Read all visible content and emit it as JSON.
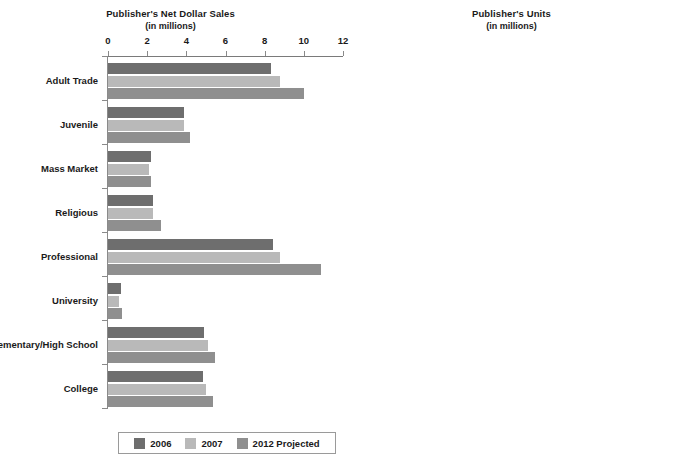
{
  "chart_data": [
    {
      "type": "bar",
      "orientation": "horizontal",
      "title": "Publisher's Net Dollar Sales",
      "subtitle": "(in millions)",
      "xlabel": "",
      "ylabel": "",
      "xlim": [
        0,
        12
      ],
      "xticks": [
        0,
        2,
        4,
        6,
        8,
        10,
        12
      ],
      "xtick_labels": [
        "0",
        "2",
        "4",
        "6",
        "8",
        "10",
        "12"
      ],
      "grid": false,
      "legend_position": "bottom",
      "categories": [
        "Adult Trade",
        "Juvenile",
        "Mass Market",
        "Religious",
        "Professional",
        "University",
        "Elementary/High School",
        "College"
      ],
      "series": [
        {
          "name": "2006",
          "color": "#6e6e6e",
          "values": [
            8.3,
            3.9,
            2.2,
            2.3,
            8.4,
            0.65,
            4.9,
            4.85
          ]
        },
        {
          "name": "2007",
          "color": "#b9b9b9",
          "values": [
            8.8,
            3.9,
            2.1,
            2.3,
            8.8,
            0.55,
            5.1,
            5.0
          ]
        },
        {
          "name": "2012 Projected",
          "color": "#8f8f8f",
          "values": [
            10.0,
            4.2,
            2.2,
            2.7,
            10.9,
            0.7,
            5.45,
            5.35
          ]
        }
      ]
    },
    {
      "type": "bar",
      "orientation": "horizontal",
      "title": "Publisher's Units",
      "subtitle": "(in millions)",
      "xlabel": "",
      "ylabel": "",
      "xlim": [
        0,
        1000
      ],
      "xticks": [
        0,
        200,
        400,
        600,
        800,
        1000
      ],
      "xtick_labels": [
        "0",
        "200",
        "400",
        "600",
        "800",
        "1000"
      ],
      "grid": false,
      "legend_position": "bottom",
      "categories": [
        "Adult Trade",
        "Juvenile",
        "Mass Market",
        "Religious",
        "Professional",
        "University",
        "Elementary/High School",
        "College"
      ],
      "series": [
        {
          "name": "2006",
          "color": "#6e6e6e",
          "values": [
            800,
            855,
            575,
            215,
            255,
            40,
            165,
            105
          ]
        },
        {
          "name": "2007",
          "color": "#b9b9b9",
          "values": [
            815,
            875,
            540,
            225,
            250,
            35,
            165,
            100
          ]
        },
        {
          "name": "2012 Projected",
          "color": "#8f8f8f",
          "values": [
            830,
            850,
            490,
            270,
            265,
            45,
            205,
            105
          ]
        }
      ]
    }
  ],
  "legend": {
    "items": [
      {
        "label": "2006",
        "color": "#6e6e6e"
      },
      {
        "label": "2007",
        "color": "#b9b9b9"
      },
      {
        "label": "2012 Projected",
        "color": "#8f8f8f"
      }
    ]
  }
}
